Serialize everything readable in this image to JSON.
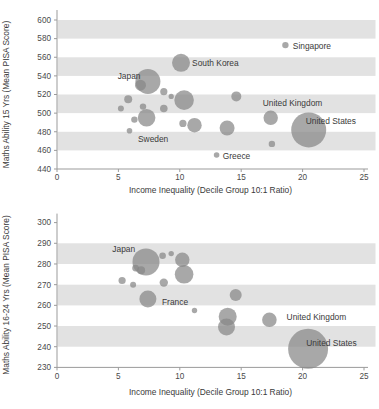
{
  "page": {
    "background": "#ffffff"
  },
  "colors": {
    "band": "#e2e2e2",
    "bubble_fill": "#878787",
    "bubble_opacity": 0.72,
    "axis": "#9b9b9b",
    "tick_text": "#4a4a4a",
    "label_text": "#3a3a3a"
  },
  "chart_data": [
    {
      "type": "scatter",
      "name": "maths-ability-15yr-vs-inequality",
      "title": "",
      "xlabel": "Income Inequality (Decile Group 10:1 Ratio)",
      "ylabel": "Maths Ability 15 Yrs (Mean PISA Score)",
      "xlim": [
        0,
        25
      ],
      "xtick_step": 5,
      "ylim": [
        440,
        600
      ],
      "ytick_step": 20,
      "grid": false,
      "legend": null,
      "shaded_bands": [
        [
          460,
          480
        ],
        [
          500,
          520
        ],
        [
          540,
          560
        ],
        [
          580,
          600
        ]
      ],
      "points": [
        {
          "x": 5.2,
          "y": 505,
          "r": 3
        },
        {
          "x": 5.8,
          "y": 515,
          "r": 4
        },
        {
          "x": 5.9,
          "y": 481,
          "r": 2.8,
          "label": "Sweden",
          "label_x": 6.6,
          "label_y": 472,
          "label_anchor": "start"
        },
        {
          "x": 6.3,
          "y": 493,
          "r": 3.2
        },
        {
          "x": 6.8,
          "y": 530,
          "r": 5.5
        },
        {
          "x": 7.0,
          "y": 507,
          "r": 3.2
        },
        {
          "x": 7.4,
          "y": 534,
          "r": 12.5,
          "label": "Japan",
          "label_x": 6.8,
          "label_y": 540,
          "label_anchor": "end"
        },
        {
          "x": 7.3,
          "y": 495,
          "r": 8.8
        },
        {
          "x": 8.7,
          "y": 523,
          "r": 3.6
        },
        {
          "x": 8.7,
          "y": 505,
          "r": 3.8
        },
        {
          "x": 9.3,
          "y": 518,
          "r": 2.6
        },
        {
          "x": 10.1,
          "y": 554,
          "r": 9,
          "label": "South Korea",
          "label_x": 11.0,
          "label_y": 553.5,
          "label_anchor": "start"
        },
        {
          "x": 10.35,
          "y": 514,
          "r": 9.8
        },
        {
          "x": 10.25,
          "y": 489,
          "r": 3.6
        },
        {
          "x": 11.2,
          "y": 487,
          "r": 7.2
        },
        {
          "x": 13.0,
          "y": 455,
          "r": 2.8,
          "label": "Greece",
          "label_x": 13.5,
          "label_y": 454.5,
          "label_anchor": "start"
        },
        {
          "x": 13.85,
          "y": 484,
          "r": 7.5
        },
        {
          "x": 14.6,
          "y": 518,
          "r": 5
        },
        {
          "x": 17.4,
          "y": 495,
          "r": 7.2,
          "label": "United Kingdom",
          "label_x": 16.75,
          "label_y": 510.5,
          "label_anchor": "start"
        },
        {
          "x": 17.5,
          "y": 467,
          "r": 3.2
        },
        {
          "x": 18.6,
          "y": 573,
          "r": 3.2,
          "label": "Singapore",
          "label_x": 19.2,
          "label_y": 572.5,
          "label_anchor": "start"
        },
        {
          "x": 20.5,
          "y": 482,
          "r": 17.5,
          "label": "United States",
          "label_x": 20.25,
          "label_y": 491.5,
          "label_anchor": "start"
        }
      ]
    },
    {
      "type": "scatter",
      "name": "maths-ability-16-24yr-vs-inequality",
      "title": "",
      "xlabel": "Income Inequality (Decile Group 10:1 Ratio)",
      "ylabel": "Maths Ability 16-24 Yrs (Mean PISA Score)",
      "xlim": [
        0,
        25
      ],
      "xtick_step": 5,
      "ylim": [
        230,
        300
      ],
      "ytick_step": 10,
      "grid": false,
      "legend": null,
      "shaded_bands": [
        [
          240,
          250
        ],
        [
          260,
          270
        ],
        [
          280,
          290
        ]
      ],
      "points": [
        {
          "x": 5.3,
          "y": 272,
          "r": 3.6
        },
        {
          "x": 6.2,
          "y": 270,
          "r": 3
        },
        {
          "x": 6.4,
          "y": 278,
          "r": 3.4
        },
        {
          "x": 6.85,
          "y": 277,
          "r": 4
        },
        {
          "x": 7.25,
          "y": 281,
          "r": 13.5,
          "label": "Japan",
          "label_x": 4.5,
          "label_y": 287.5,
          "label_anchor": "start"
        },
        {
          "x": 7.4,
          "y": 263,
          "r": 8.5,
          "label": "France",
          "label_x": 8.55,
          "label_y": 261.5,
          "label_anchor": "start"
        },
        {
          "x": 8.6,
          "y": 284,
          "r": 3.3
        },
        {
          "x": 8.7,
          "y": 271,
          "r": 4.2
        },
        {
          "x": 9.3,
          "y": 285,
          "r": 2.7
        },
        {
          "x": 10.2,
          "y": 282,
          "r": 7.2
        },
        {
          "x": 10.35,
          "y": 275,
          "r": 9.3
        },
        {
          "x": 11.2,
          "y": 257.5,
          "r": 2.7
        },
        {
          "x": 13.9,
          "y": 254.5,
          "r": 9
        },
        {
          "x": 13.8,
          "y": 249.5,
          "r": 8.5
        },
        {
          "x": 14.55,
          "y": 265,
          "r": 6
        },
        {
          "x": 17.3,
          "y": 253,
          "r": 7.3,
          "label": "United Kingdom",
          "label_x": 18.7,
          "label_y": 254.5,
          "label_anchor": "start"
        },
        {
          "x": 20.45,
          "y": 239,
          "r": 20,
          "label": "United States",
          "label_x": 20.3,
          "label_y": 242,
          "label_anchor": "start"
        }
      ]
    }
  ]
}
